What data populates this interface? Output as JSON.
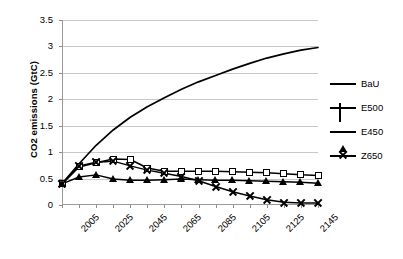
{
  "chart_data": {
    "type": "line",
    "title": "",
    "xlabel": "",
    "ylabel": "CO2 emissions (GtC)",
    "xlim": [
      2005,
      2155
    ],
    "ylim": [
      0,
      3.5
    ],
    "yticks": [
      "0",
      "0.5",
      "1",
      "1.5",
      "2",
      "2.5",
      "3",
      "3.5"
    ],
    "ytick_values": [
      0,
      0.5,
      1,
      1.5,
      2,
      2.5,
      3,
      3.5
    ],
    "xticks": [
      "2005",
      "2025",
      "2045",
      "2065",
      "2085",
      "2105",
      "2125",
      "2145"
    ],
    "xtick_values": [
      2005,
      2025,
      2045,
      2065,
      2085,
      2105,
      2125,
      2145
    ],
    "grid": "horizontal",
    "legend_position": "right",
    "x": [
      2005,
      2015,
      2025,
      2035,
      2045,
      2055,
      2065,
      2075,
      2085,
      2095,
      2105,
      2115,
      2125,
      2135,
      2145,
      2155
    ],
    "series": [
      {
        "name": "BaU",
        "marker": "none",
        "color": "#000000",
        "values": [
          0.4,
          0.78,
          1.13,
          1.42,
          1.66,
          1.86,
          2.03,
          2.19,
          2.33,
          2.45,
          2.57,
          2.68,
          2.78,
          2.86,
          2.93,
          2.98
        ]
      },
      {
        "name": "E500",
        "marker": "open-square",
        "color": "#000000",
        "values": [
          0.4,
          0.72,
          0.8,
          0.87,
          0.86,
          0.7,
          0.64,
          0.64,
          0.64,
          0.64,
          0.63,
          0.62,
          0.61,
          0.59,
          0.57,
          0.56
        ]
      },
      {
        "name": "E450",
        "marker": "filled-triangle",
        "color": "#000000",
        "values": [
          0.4,
          0.53,
          0.57,
          0.49,
          0.47,
          0.47,
          0.48,
          0.49,
          0.48,
          0.47,
          0.47,
          0.46,
          0.45,
          0.44,
          0.43,
          0.41
        ]
      },
      {
        "name": "Z650",
        "marker": "x",
        "color": "#000000",
        "values": [
          0.4,
          0.74,
          0.81,
          0.83,
          0.74,
          0.66,
          0.6,
          0.54,
          0.46,
          0.35,
          0.25,
          0.17,
          0.1,
          0.05,
          0.04,
          0.04
        ]
      }
    ]
  },
  "legend": {
    "items": [
      {
        "label": "BaU"
      },
      {
        "label": "E500"
      },
      {
        "label": "E450"
      },
      {
        "label": "Z650"
      }
    ]
  }
}
